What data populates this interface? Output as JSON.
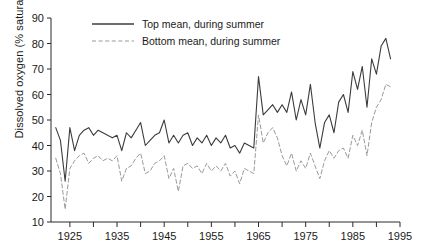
{
  "chart_data": {
    "type": "line",
    "title": "",
    "xlabel": "",
    "ylabel": "Dissolved oxygen (% saturation)",
    "xlim": [
      1921,
      1995
    ],
    "ylim": [
      10,
      90
    ],
    "ytick_step": 10,
    "xtick_step": 5,
    "xtick_label_step": 10,
    "grid": false,
    "legend_position": "top-center",
    "yticks": [
      10,
      20,
      30,
      40,
      50,
      60,
      70,
      80,
      90
    ],
    "ytick_labels": [
      "10",
      "20",
      "30",
      "40",
      "50",
      "60",
      "70",
      "80",
      "90"
    ],
    "xticks": [
      1925,
      1930,
      1935,
      1940,
      1945,
      1950,
      1955,
      1960,
      1965,
      1970,
      1975,
      1980,
      1985,
      1990,
      1995
    ],
    "xtick_labels": [
      "1925",
      "",
      "1935",
      "",
      "1945",
      "",
      "1955",
      "",
      "1965",
      "",
      "1975",
      "",
      "1985",
      "",
      "1995"
    ],
    "x": [
      1922,
      1923,
      1924,
      1925,
      1926,
      1927,
      1928,
      1929,
      1930,
      1931,
      1932,
      1933,
      1934,
      1935,
      1936,
      1937,
      1938,
      1939,
      1940,
      1941,
      1942,
      1943,
      1944,
      1945,
      1946,
      1947,
      1948,
      1949,
      1950,
      1951,
      1952,
      1953,
      1954,
      1955,
      1956,
      1957,
      1958,
      1959,
      1960,
      1961,
      1962,
      1963,
      1964,
      1965,
      1966,
      1967,
      1968,
      1969,
      1970,
      1971,
      1972,
      1973,
      1974,
      1975,
      1976,
      1977,
      1978,
      1979,
      1980,
      1981,
      1982,
      1983,
      1984,
      1985,
      1986,
      1987,
      1988,
      1989,
      1990,
      1991,
      1992,
      1993
    ],
    "series": [
      {
        "name": "Top mean, during summer",
        "style": "solid",
        "color": "#3c3c3c",
        "values": [
          47,
          42,
          26,
          47,
          38,
          44,
          46,
          47,
          44,
          46,
          45,
          44,
          43,
          44,
          38,
          45,
          43,
          46,
          49,
          40,
          42,
          44,
          45,
          50,
          41,
          44,
          41,
          44,
          45,
          40,
          43,
          41,
          44,
          40,
          43,
          41,
          44,
          39,
          40,
          37,
          41,
          40,
          39,
          67,
          52,
          54,
          56,
          53,
          56,
          53,
          61,
          50,
          58,
          52,
          64,
          49,
          39,
          49,
          52,
          45,
          57,
          60,
          53,
          69,
          62,
          71,
          55,
          74,
          68,
          79,
          82,
          74
        ]
      },
      {
        "name": "Bottom mean, during summer",
        "style": "dashed",
        "color": "#9a9a9a",
        "values": [
          35,
          29,
          15,
          31,
          34,
          36,
          37,
          33,
          35,
          36,
          34,
          35,
          34,
          36,
          26,
          31,
          32,
          35,
          37,
          29,
          30,
          33,
          34,
          36,
          27,
          31,
          22,
          32,
          33,
          31,
          32,
          29,
          33,
          30,
          32,
          30,
          33,
          28,
          30,
          25,
          31,
          30,
          29,
          52,
          41,
          45,
          47,
          43,
          36,
          32,
          37,
          30,
          34,
          31,
          37,
          32,
          27,
          34,
          38,
          35,
          38,
          39,
          35,
          44,
          40,
          46,
          36,
          49,
          55,
          58,
          64,
          63
        ]
      }
    ]
  },
  "legend": {
    "entries": [
      {
        "label": "Top mean, during summer"
      },
      {
        "label": "Bottom mean, during summer"
      }
    ]
  }
}
